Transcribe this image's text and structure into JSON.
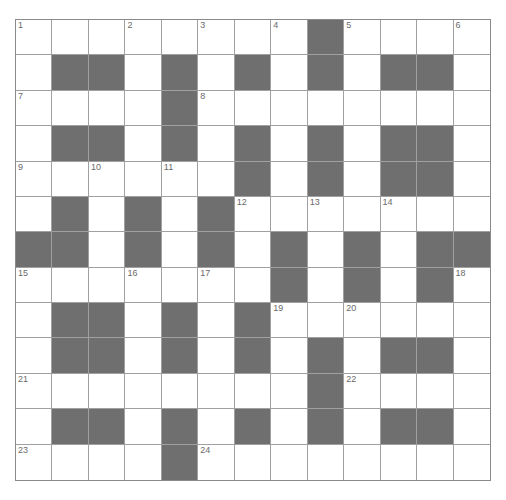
{
  "puzzle": {
    "rows": 13,
    "cols": 13,
    "colors": {
      "block": "#6f6f6f",
      "cell": "#ffffff",
      "gridline": "#a0a0a0",
      "number": "#6a6a6a"
    },
    "grid": [
      [
        "1",
        "W",
        "W",
        "2",
        "W",
        "3",
        "W",
        "4",
        "B",
        "5",
        "W",
        "W",
        "6"
      ],
      [
        "W",
        "B",
        "B",
        "W",
        "B",
        "W",
        "B",
        "W",
        "B",
        "W",
        "B",
        "B",
        "W"
      ],
      [
        "7",
        "W",
        "W",
        "W",
        "B",
        "8",
        "W",
        "W",
        "W",
        "W",
        "W",
        "W",
        "W"
      ],
      [
        "W",
        "B",
        "B",
        "W",
        "B",
        "W",
        "B",
        "W",
        "B",
        "W",
        "B",
        "B",
        "W"
      ],
      [
        "9",
        "W",
        "10",
        "W",
        "11",
        "W",
        "B",
        "W",
        "B",
        "W",
        "B",
        "B",
        "W"
      ],
      [
        "W",
        "B",
        "W",
        "B",
        "W",
        "B",
        "12",
        "W",
        "13",
        "W",
        "14",
        "W",
        "W"
      ],
      [
        "B",
        "B",
        "W",
        "B",
        "W",
        "B",
        "W",
        "B",
        "W",
        "B",
        "W",
        "B",
        "B"
      ],
      [
        "15",
        "W",
        "W",
        "16",
        "W",
        "17",
        "W",
        "B",
        "W",
        "B",
        "W",
        "B",
        "18"
      ],
      [
        "W",
        "B",
        "B",
        "W",
        "B",
        "W",
        "B",
        "19",
        "W",
        "20",
        "W",
        "W",
        "W"
      ],
      [
        "W",
        "B",
        "B",
        "W",
        "B",
        "W",
        "B",
        "W",
        "B",
        "W",
        "B",
        "B",
        "W"
      ],
      [
        "21",
        "W",
        "W",
        "W",
        "W",
        "W",
        "W",
        "W",
        "B",
        "22",
        "W",
        "W",
        "W"
      ],
      [
        "W",
        "B",
        "B",
        "W",
        "B",
        "W",
        "B",
        "W",
        "B",
        "W",
        "B",
        "B",
        "W"
      ],
      [
        "23",
        "W",
        "W",
        "W",
        "B",
        "24",
        "W",
        "W",
        "W",
        "W",
        "W",
        "W",
        "W"
      ]
    ]
  }
}
